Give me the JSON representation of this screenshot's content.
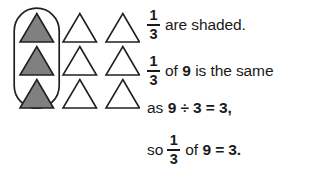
{
  "figure": {
    "diagram": {
      "rows": 3,
      "columns": 3,
      "total_shapes": 9,
      "shape": "triangle",
      "shaded_count": 3,
      "unshaded_count": 6,
      "shaded_column_index": 1,
      "grouping": "oval-ring-around-first-column",
      "colors": {
        "shaded_fill": "#808080",
        "unshaded_fill": "#ffffff",
        "outline": "#231f20",
        "ring_outline": "#231f20",
        "background": "#ffffff"
      }
    },
    "lines": [
      {
        "id": "line-1",
        "parts": [
          {
            "type": "fraction",
            "numerator": "1",
            "denominator": "3"
          },
          {
            "type": "text",
            "value": "are shaded.",
            "weight": "regular"
          }
        ]
      },
      {
        "id": "line-2",
        "parts": [
          {
            "type": "fraction",
            "numerator": "1",
            "denominator": "3"
          },
          {
            "type": "text",
            "value": "of",
            "weight": "regular"
          },
          {
            "type": "text",
            "value": "9",
            "weight": "bold"
          },
          {
            "type": "text",
            "value": "is the same",
            "weight": "regular"
          }
        ]
      },
      {
        "id": "line-3",
        "parts": [
          {
            "type": "text",
            "value": "as",
            "weight": "regular"
          },
          {
            "type": "text",
            "value": "9 ÷ 3 = 3,",
            "weight": "bold"
          }
        ]
      },
      {
        "id": "line-4",
        "parts": [
          {
            "type": "text",
            "value": "so",
            "weight": "regular"
          },
          {
            "type": "fraction",
            "numerator": "1",
            "denominator": "3"
          },
          {
            "type": "text",
            "value": "of",
            "weight": "regular"
          },
          {
            "type": "text",
            "value": "9 = 3.",
            "weight": "bold"
          }
        ]
      }
    ],
    "text": {
      "line1_fraction_numerator": "1",
      "line1_fraction_denominator": "3",
      "line1_tail": "are shaded.",
      "line2_fraction_numerator": "1",
      "line2_fraction_denominator": "3",
      "line2_of": "of",
      "line2_nine": "9",
      "line2_tail": "is the same",
      "line3_as": "as",
      "line3_equation": "9 ÷ 3 = 3,",
      "line4_so": "so",
      "line4_fraction_numerator": "1",
      "line4_fraction_denominator": "3",
      "line4_of": "of",
      "line4_equation": "9 = 3."
    }
  }
}
